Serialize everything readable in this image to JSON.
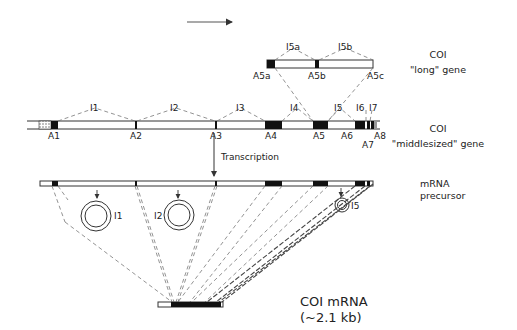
{
  "direction_arrow": {
    "label": ""
  },
  "long_gene": {
    "title": "COI",
    "subtitle": "\"long\" gene",
    "exons": [
      "A5a",
      "A5b",
      "A5c"
    ],
    "introns": [
      "I5a",
      "I5b"
    ]
  },
  "middle_gene": {
    "title": "COI",
    "subtitle": "\"middlesized\" gene",
    "exons": [
      "A1",
      "A2",
      "A3",
      "A4",
      "A5",
      "A6",
      "A7",
      "A8"
    ],
    "introns": [
      "I1",
      "I2",
      "I3",
      "I4",
      "I5",
      "I6",
      "I7"
    ]
  },
  "transcription": {
    "label": "Transcription"
  },
  "precursor": {
    "line1": "mRNA",
    "line2": "precursor"
  },
  "excised_introns": [
    "I1",
    "I2",
    "I5"
  ],
  "mature_mrna": {
    "line1": "COI mRNA",
    "line2": "(~2.1 kb)"
  },
  "colors": {
    "exon": "#111111",
    "line": "#333333",
    "dash": "#777777"
  }
}
